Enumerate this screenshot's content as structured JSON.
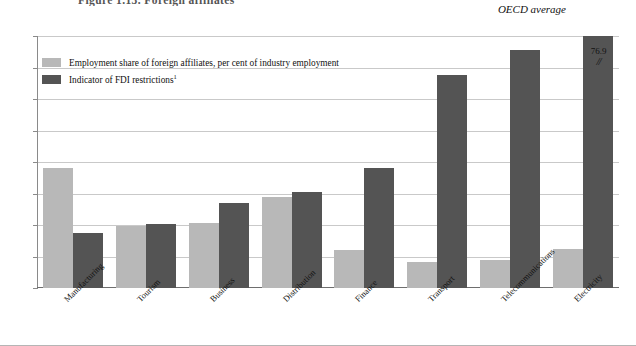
{
  "figure": {
    "main_title": "Figure 1.13.  Foreign affiliates",
    "subtitle": "OECD average",
    "break_value": "76.9",
    "break_symbol": "//"
  },
  "legend": {
    "items": [
      {
        "label": "Employment share of foreign affiliates, per cent of industry employment",
        "color": "#b8b8b8",
        "swatch": "light-swatch"
      },
      {
        "label": "Indicator of FDI restrictions",
        "footnote": "1",
        "color": "#545454",
        "swatch": "dark-swatch"
      }
    ]
  },
  "chart_data": {
    "type": "bar",
    "title": "Figure 1.13.  Foreign affiliates",
    "subtitle": "OECD average",
    "xlabel": "",
    "ylabel": "",
    "ylim": [
      0,
      40
    ],
    "yticks": [
      "0",
      "5",
      "10",
      "15",
      "20",
      "25",
      "30",
      "35",
      "40"
    ],
    "grid": true,
    "legend_position": "top-left",
    "categories": [
      "Manufacturing",
      "Tourism",
      "Business",
      "Distribution",
      "Finance",
      "Transport",
      "Telecommunications",
      "Electricity"
    ],
    "series": [
      {
        "name": "Employment share of foreign affiliates, per cent of industry employment",
        "color": "#b8b8b8",
        "values": [
          19.0,
          9.9,
          10.3,
          14.5,
          6.0,
          4.1,
          4.5,
          6.2
        ]
      },
      {
        "name": "Indicator of FDI restrictions",
        "color": "#545454",
        "values": [
          8.8,
          10.1,
          13.5,
          15.2,
          19.0,
          33.8,
          37.8,
          40.0
        ],
        "annotations": [
          null,
          null,
          null,
          null,
          null,
          null,
          null,
          "76.9"
        ]
      }
    ]
  }
}
